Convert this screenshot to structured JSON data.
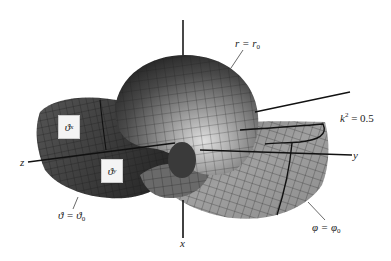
{
  "figure": {
    "type": "3d-surface-diagram",
    "background": "#ffffff",
    "surface_colors": {
      "dark": "#3a3a3a",
      "mid": "#6e6e6e",
      "light": "#a9a9a9",
      "highlight": "#d6d6d6",
      "grid": "#1e1e1e"
    },
    "axes": {
      "x": {
        "label": "x"
      },
      "y": {
        "label": "y"
      },
      "z": {
        "label": "z"
      }
    },
    "annotations": {
      "sphere": {
        "lhs": "r = r",
        "sub": "0"
      },
      "modulus": {
        "lhs": "k",
        "sup": "2",
        "rhs": " = 0.5"
      },
      "cone": {
        "lhs": "ϑ = ϑ",
        "sub": "0"
      },
      "plane": {
        "lhs": "φ = φ",
        "sub": "0"
      }
    },
    "tags": {
      "theta_x": {
        "sym": "ϑ",
        "sub": "x"
      },
      "theta_y": {
        "sym": "ϑ",
        "sub": "y"
      }
    }
  }
}
